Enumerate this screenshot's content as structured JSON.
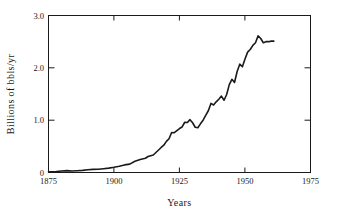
{
  "chart_data": {
    "type": "line",
    "title": "",
    "xlabel": "Years",
    "ylabel": "Billions of bbls/yr",
    "xlim": [
      1875,
      1975
    ],
    "ylim": [
      0,
      3.0
    ],
    "xticks": [
      1875,
      1900,
      1925,
      1950,
      1975
    ],
    "xtick_labels": [
      "1875",
      "1900",
      "1925",
      "1950",
      "1975"
    ],
    "yticks": [
      0,
      1.0,
      2.0,
      3.0
    ],
    "ytick_labels": [
      "0",
      "1.0",
      "2.0",
      "3.0"
    ],
    "grid": false,
    "legend": null,
    "line_color": "#1a1a1a",
    "line_width": 1.6,
    "series": [
      {
        "name": "World crude oil production",
        "x": [
          1875,
          1876,
          1877,
          1878,
          1879,
          1880,
          1881,
          1882,
          1883,
          1884,
          1885,
          1886,
          1887,
          1888,
          1889,
          1890,
          1891,
          1892,
          1893,
          1894,
          1895,
          1896,
          1897,
          1898,
          1899,
          1900,
          1901,
          1902,
          1903,
          1904,
          1905,
          1906,
          1907,
          1908,
          1909,
          1910,
          1911,
          1912,
          1913,
          1914,
          1915,
          1916,
          1917,
          1918,
          1919,
          1920,
          1921,
          1922,
          1923,
          1924,
          1925,
          1926,
          1927,
          1928,
          1929,
          1930,
          1931,
          1932,
          1933,
          1934,
          1935,
          1936,
          1937,
          1938,
          1939,
          1940,
          1941,
          1942,
          1943,
          1944,
          1945,
          1946,
          1947,
          1948,
          1949,
          1950,
          1951,
          1952,
          1953,
          1954,
          1955,
          1956,
          1957,
          1958,
          1959,
          1960,
          1961
        ],
        "values": [
          0.011,
          0.012,
          0.014,
          0.016,
          0.021,
          0.03,
          0.033,
          0.037,
          0.031,
          0.03,
          0.031,
          0.035,
          0.037,
          0.041,
          0.047,
          0.054,
          0.063,
          0.06,
          0.062,
          0.061,
          0.066,
          0.073,
          0.078,
          0.083,
          0.09,
          0.1,
          0.11,
          0.12,
          0.132,
          0.145,
          0.16,
          0.16,
          0.194,
          0.216,
          0.228,
          0.25,
          0.257,
          0.272,
          0.305,
          0.315,
          0.335,
          0.383,
          0.438,
          0.478,
          0.521,
          0.594,
          0.645,
          0.765,
          0.91,
          0.94,
          1.01,
          1.095,
          1.265,
          1.325,
          1.405,
          1.41,
          1.27,
          1.235,
          1.315,
          1.45,
          1.56,
          1.74,
          1.98,
          1.99,
          2.09,
          2.15,
          2.22,
          2.07,
          2.23,
          2.4,
          2.59,
          2.73,
          2.98,
          3.18,
          3.13,
          3.8,
          4.27,
          4.52,
          4.84,
          5.02,
          5.63,
          6.01,
          6.2,
          6.28,
          6.67,
          7.06,
          7.39
        ]
      }
    ],
    "display_points": [
      [
        1875,
        0.012
      ],
      [
        1878,
        0.016
      ],
      [
        1880,
        0.03
      ],
      [
        1882,
        0.036
      ],
      [
        1884,
        0.029
      ],
      [
        1886,
        0.034
      ],
      [
        1888,
        0.04
      ],
      [
        1890,
        0.053
      ],
      [
        1892,
        0.06
      ],
      [
        1894,
        0.061
      ],
      [
        1896,
        0.073
      ],
      [
        1898,
        0.083
      ],
      [
        1900,
        0.1
      ],
      [
        1902,
        0.12
      ],
      [
        1904,
        0.145
      ],
      [
        1906,
        0.16
      ],
      [
        1908,
        0.216
      ],
      [
        1910,
        0.25
      ],
      [
        1912,
        0.272
      ],
      [
        1913,
        0.305
      ],
      [
        1915,
        0.335
      ],
      [
        1916,
        0.383
      ],
      [
        1918,
        0.478
      ],
      [
        1919,
        0.521
      ],
      [
        1920,
        0.594
      ],
      [
        1921,
        0.645
      ],
      [
        1922,
        0.765
      ],
      [
        1923,
        0.76
      ],
      [
        1924,
        0.8
      ],
      [
        1925,
        0.84
      ],
      [
        1926,
        0.87
      ],
      [
        1927,
        0.96
      ],
      [
        1928,
        0.955
      ],
      [
        1929,
        1.01
      ],
      [
        1930,
        0.95
      ],
      [
        1931,
        0.865
      ],
      [
        1932,
        0.855
      ],
      [
        1933,
        0.93
      ],
      [
        1934,
        1.0
      ],
      [
        1935,
        1.09
      ],
      [
        1936,
        1.18
      ],
      [
        1937,
        1.32
      ],
      [
        1938,
        1.29
      ],
      [
        1939,
        1.35
      ],
      [
        1940,
        1.4
      ],
      [
        1941,
        1.46
      ],
      [
        1942,
        1.38
      ],
      [
        1943,
        1.49
      ],
      [
        1944,
        1.68
      ],
      [
        1945,
        1.78
      ],
      [
        1946,
        1.72
      ],
      [
        1947,
        1.93
      ],
      [
        1948,
        2.07
      ],
      [
        1949,
        2.02
      ],
      [
        1950,
        2.17
      ],
      [
        1951,
        2.3
      ],
      [
        1952,
        2.35
      ],
      [
        1953,
        2.43
      ],
      [
        1954,
        2.48
      ],
      [
        1955,
        2.61
      ],
      [
        1956,
        2.56
      ],
      [
        1957,
        2.48
      ],
      [
        1958,
        2.5
      ],
      [
        1959,
        2.5
      ],
      [
        1960,
        2.51
      ],
      [
        1961,
        2.51
      ]
    ]
  },
  "axes": {
    "y_title": "Billions of bbls/yr",
    "x_title": "Years",
    "y_labels": [
      "3.0",
      "2.0",
      "1.0",
      "0"
    ],
    "x_labels": [
      "1875",
      "1900",
      "1925",
      "1950",
      "1975"
    ]
  }
}
